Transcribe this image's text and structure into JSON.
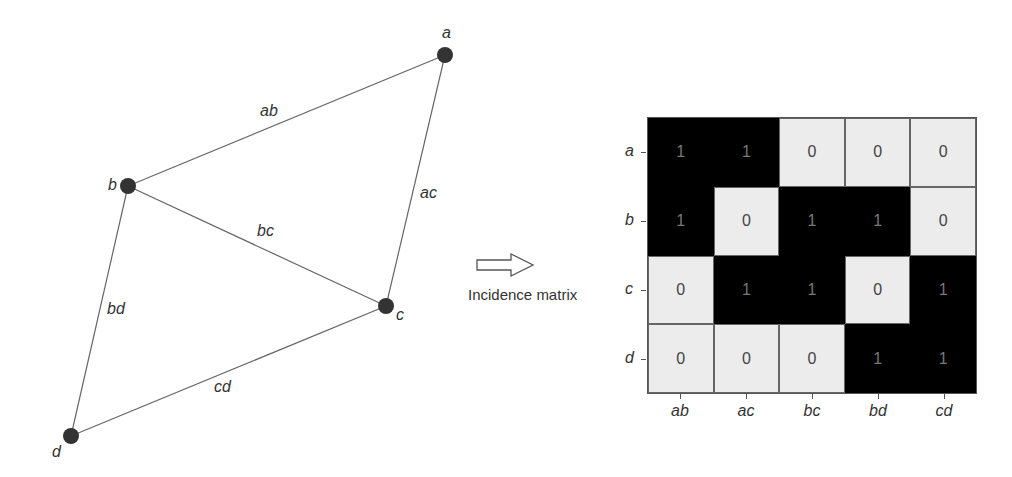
{
  "graph": {
    "nodes": [
      {
        "id": "a",
        "label": "a",
        "x": 445,
        "y": 55
      },
      {
        "id": "b",
        "label": "b",
        "x": 128,
        "y": 186
      },
      {
        "id": "c",
        "label": "c",
        "x": 386,
        "y": 306
      },
      {
        "id": "d",
        "label": "d",
        "x": 71,
        "y": 436
      }
    ],
    "edges": [
      {
        "id": "ab",
        "label": "ab",
        "from": "a",
        "to": "b"
      },
      {
        "id": "ac",
        "label": "ac",
        "from": "a",
        "to": "c"
      },
      {
        "id": "bc",
        "label": "bc",
        "from": "b",
        "to": "c"
      },
      {
        "id": "bd",
        "label": "bd",
        "from": "b",
        "to": "d"
      },
      {
        "id": "cd",
        "label": "cd",
        "from": "c",
        "to": "d"
      }
    ]
  },
  "arrow": {
    "caption": "Incidence matrix"
  },
  "matrix": {
    "row_labels": [
      "a",
      "b",
      "c",
      "d"
    ],
    "col_labels": [
      "ab",
      "ac",
      "bc",
      "bd",
      "cd"
    ],
    "values": [
      [
        1,
        1,
        0,
        0,
        0
      ],
      [
        1,
        0,
        1,
        1,
        0
      ],
      [
        0,
        1,
        1,
        0,
        1
      ],
      [
        0,
        0,
        0,
        1,
        1
      ]
    ]
  },
  "colors": {
    "one_cell": "#000000",
    "zero_cell": "#ececec",
    "node": "#333333",
    "edge": "#666666"
  }
}
